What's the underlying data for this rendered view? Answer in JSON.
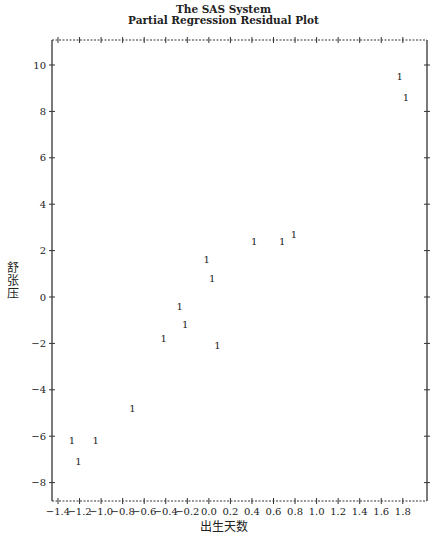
{
  "chart_data": {
    "type": "scatter",
    "title": "The SAS System",
    "subtitle": "Partial Regression Residual Plot",
    "xlabel": "出生天数",
    "ylabel": "舒张压",
    "marker": "1",
    "xlim": [
      -1.45,
      1.93
    ],
    "ylim": [
      -8.8,
      11.1
    ],
    "xticks": [
      -1.4,
      -1.2,
      -1.0,
      -0.8,
      -0.6,
      -0.4,
      -0.2,
      0.0,
      0.2,
      0.4,
      0.6,
      0.8,
      1.0,
      1.2,
      1.4,
      1.6,
      1.8
    ],
    "xtick_labels": [
      "-1.4",
      "-1.2",
      "-1.0",
      "-0.8",
      "-0.6",
      "-0.4",
      "-0.2",
      "0.0",
      "0.2",
      "0.4",
      "0.6",
      "0.8",
      "1.0",
      "1.2",
      "1.4",
      "1.6",
      "1.8"
    ],
    "yticks": [
      -8,
      -6,
      -4,
      -2,
      0,
      2,
      4,
      6,
      8,
      10
    ],
    "ytick_labels": [
      "-8",
      "-6",
      "-4",
      "-2",
      "0",
      "2",
      "4",
      "6",
      "8",
      "10"
    ],
    "grid": false,
    "points": [
      {
        "x": 1.77,
        "y": 9.5
      },
      {
        "x": 1.83,
        "y": 8.6
      },
      {
        "x": 0.42,
        "y": 2.4
      },
      {
        "x": 0.68,
        "y": 2.4
      },
      {
        "x": 0.79,
        "y": 2.7
      },
      {
        "x": -0.02,
        "y": 1.6
      },
      {
        "x": 0.03,
        "y": 0.8
      },
      {
        "x": -0.27,
        "y": -0.4
      },
      {
        "x": -0.22,
        "y": -1.2
      },
      {
        "x": -0.42,
        "y": -1.8
      },
      {
        "x": 0.08,
        "y": -2.1
      },
      {
        "x": -0.71,
        "y": -4.8
      },
      {
        "x": -1.27,
        "y": -6.2
      },
      {
        "x": -1.05,
        "y": -6.2
      },
      {
        "x": -1.21,
        "y": -7.1
      }
    ]
  },
  "header": {
    "title": "The SAS System",
    "subtitle": "Partial Regression Residual Plot"
  },
  "axes": {
    "xlabel": "出生天数",
    "ylabel": "舒张压"
  }
}
